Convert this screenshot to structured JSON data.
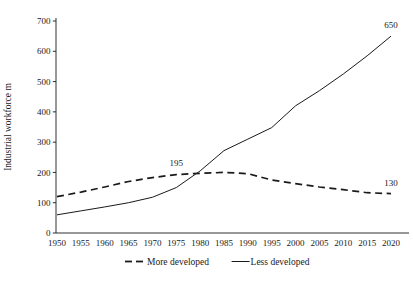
{
  "chart_data": {
    "type": "line",
    "title": "",
    "xlabel": "",
    "ylabel": "Industrial workforce m",
    "xlim": [
      1950,
      2020
    ],
    "ylim": [
      0,
      700
    ],
    "grid": false,
    "legend_position": "bottom",
    "x": [
      1950,
      1955,
      1960,
      1965,
      1970,
      1975,
      1980,
      1985,
      1990,
      1995,
      2000,
      2005,
      2010,
      2015,
      2020
    ],
    "xtick_labels": [
      "1950",
      "1955",
      "1960",
      "1965",
      "1970",
      "1975",
      "1980",
      "1985",
      "1990",
      "1995",
      "2000",
      "2005",
      "2010",
      "2015",
      "2020"
    ],
    "ytick_labels": [
      "0",
      "100",
      "200",
      "300",
      "400",
      "500",
      "600",
      "700"
    ],
    "yticks": [
      0,
      100,
      200,
      300,
      400,
      500,
      600,
      700
    ],
    "series": [
      {
        "name": "More developed",
        "style": "dashed",
        "color": "#1a1a1a",
        "values": [
          120,
          135,
          152,
          170,
          183,
          193,
          197,
          200,
          196,
          175,
          163,
          152,
          143,
          133,
          130
        ]
      },
      {
        "name": "Less developed",
        "style": "solid",
        "color": "#1a1a1a",
        "values": [
          60,
          73,
          86,
          100,
          118,
          150,
          205,
          272,
          310,
          348,
          420,
          470,
          525,
          585,
          650
        ]
      }
    ],
    "annotations": [
      {
        "label": "195",
        "x": 1975,
        "y": 195,
        "series": "crossover"
      },
      {
        "label": "650",
        "x": 2020,
        "y": 650,
        "series": "Less developed"
      },
      {
        "label": "130",
        "x": 2020,
        "y": 130,
        "series": "More developed"
      }
    ]
  },
  "legend": {
    "items": [
      {
        "label": "More developed",
        "style": "dashed"
      },
      {
        "label": "Less developed",
        "style": "solid"
      }
    ]
  },
  "axis": {
    "y_title": "Industrial workforce m"
  }
}
